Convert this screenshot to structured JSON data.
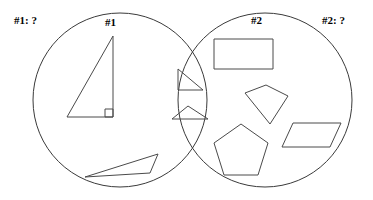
{
  "diagram": {
    "type": "venn-diagram",
    "title_visible": false,
    "stroke_color": "#4a4a4a",
    "circle_stroke_color": "#3a3a3a",
    "background_color": "#ffffff",
    "labels": {
      "outer_left": "#1: ?",
      "inner_left": "#1",
      "inner_right": "#2",
      "outer_right": "#2: ?"
    },
    "circles": [
      {
        "name": "set-1",
        "cx": 120,
        "cy": 100,
        "r": 87
      },
      {
        "name": "set-2",
        "cx": 265,
        "cy": 100,
        "r": 87
      }
    ],
    "regions": {
      "left_only": {
        "name": "set-1-only",
        "shape_count": 2,
        "shapes": [
          {
            "name": "right-triangle-large",
            "kind": "triangle",
            "points": "113,36 113,117 67,117",
            "right_angle_marker": "105,109 113,109 113,117 105,117"
          },
          {
            "name": "obtuse-thin-triangle",
            "kind": "triangle",
            "points": "158,154 150,173 85,177"
          }
        ]
      },
      "intersection": {
        "name": "set-1-and-set-2",
        "shape_count": 2,
        "shapes": [
          {
            "name": "small-right-triangle",
            "kind": "triangle",
            "points": "178,69 178,90 203,90"
          },
          {
            "name": "small-flat-triangle",
            "kind": "triangle",
            "points": "188,106 208,119 172,119"
          }
        ]
      },
      "right_only": {
        "name": "set-2-only",
        "shape_count": 4,
        "shapes": [
          {
            "name": "rectangle",
            "kind": "rectangle",
            "points": "214,39 273,39 273,69 214,69"
          },
          {
            "name": "kite-quadrilateral",
            "kind": "quadrilateral",
            "points": "266,85 288,96 270,124 245,93"
          },
          {
            "name": "pentagon",
            "kind": "pentagon",
            "points": "241,124 268,143 258,175 224,175 214,143"
          },
          {
            "name": "parallelogram",
            "kind": "parallelogram",
            "points": "293,123 341,123 330,147 282,147"
          }
        ]
      }
    }
  }
}
